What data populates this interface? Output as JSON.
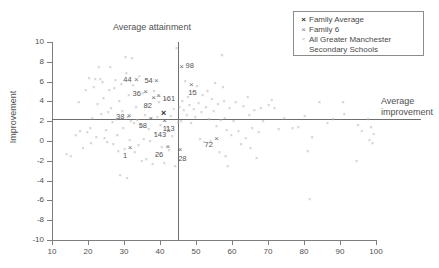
{
  "chart_data": {
    "type": "scatter",
    "title": "",
    "xlabel": "",
    "ylabel": "Improvement",
    "xlim": [
      10,
      100
    ],
    "ylim": [
      -10,
      10
    ],
    "xticks": [
      10,
      20,
      30,
      40,
      50,
      60,
      70,
      80,
      90,
      100
    ],
    "yticks": [
      -10,
      -8,
      -6,
      -4,
      -2,
      0,
      2,
      4,
      6,
      8,
      10
    ],
    "grid": false,
    "annotations": {
      "average_attainment_label": "Average attainment",
      "average_improvement_label_line1": "Average",
      "average_improvement_label_line2": "improvement",
      "average_attainment_value": 45,
      "average_improvement_value": 2.2
    },
    "legend": {
      "position": "top-right",
      "entries": [
        {
          "marker": "x",
          "style": "bold",
          "label": "Family Average"
        },
        {
          "marker": "x",
          "style": "medium",
          "label": "Family 6"
        },
        {
          "marker": "x",
          "style": "small",
          "label": "All Greater Manchester",
          "label_line2": "Secondary Schools"
        }
      ]
    },
    "series": [
      {
        "name": "Family Average",
        "marker": "bold-x",
        "points": [
          {
            "x": 41.0,
            "y": 2.7,
            "label": ""
          }
        ]
      },
      {
        "name": "Family 6",
        "marker": "x",
        "points": [
          {
            "x": 33.4,
            "y": 6.2,
            "label": "44"
          },
          {
            "x": 39.0,
            "y": 6.1,
            "label": "54"
          },
          {
            "x": 36.0,
            "y": 4.9,
            "label": "36"
          },
          {
            "x": 38.2,
            "y": 4.3,
            "label": "82"
          },
          {
            "x": 39.6,
            "y": 4.5,
            "label": "161"
          },
          {
            "x": 31.4,
            "y": 2.5,
            "label": "38"
          },
          {
            "x": 37.4,
            "y": 2.2,
            "label": "58"
          },
          {
            "x": 41.3,
            "y": 2.0,
            "label": "113"
          },
          {
            "x": 42.4,
            "y": 1.0,
            "label": "143"
          },
          {
            "x": 42.2,
            "y": -0.6,
            "label": "26"
          },
          {
            "x": 31.7,
            "y": -0.7,
            "label": "1"
          },
          {
            "x": 45.6,
            "y": -0.9,
            "label": "28"
          },
          {
            "x": 46.0,
            "y": 7.5,
            "label": "98"
          },
          {
            "x": 48.7,
            "y": 5.7,
            "label": "15"
          },
          {
            "x": 55.7,
            "y": 0.2,
            "label": "72"
          }
        ]
      },
      {
        "name": "All Greater Manchester Secondary Schools",
        "marker": "dot-x",
        "points": [
          {
            "x": 14.0,
            "y": -1.4
          },
          {
            "x": 15.2,
            "y": -1.6
          },
          {
            "x": 16.6,
            "y": 0.6
          },
          {
            "x": 17.4,
            "y": 3.9
          },
          {
            "x": 17.8,
            "y": 1.0
          },
          {
            "x": 18.6,
            "y": -0.8
          },
          {
            "x": 19.4,
            "y": 5.1
          },
          {
            "x": 19.8,
            "y": 0.9
          },
          {
            "x": 20.3,
            "y": 6.3
          },
          {
            "x": 20.6,
            "y": 1.3
          },
          {
            "x": 20.8,
            "y": -0.3
          },
          {
            "x": 21.2,
            "y": 2.3
          },
          {
            "x": 21.6,
            "y": 5.4
          },
          {
            "x": 22.0,
            "y": 6.2
          },
          {
            "x": 22.3,
            "y": 0.4
          },
          {
            "x": 22.6,
            "y": 3.7
          },
          {
            "x": 23.0,
            "y": 7.4
          },
          {
            "x": 23.4,
            "y": 6.2
          },
          {
            "x": 23.7,
            "y": 2.7
          },
          {
            "x": 24.0,
            "y": 5.9
          },
          {
            "x": 24.3,
            "y": 4.3
          },
          {
            "x": 24.6,
            "y": 0.3
          },
          {
            "x": 25.0,
            "y": 1.1
          },
          {
            "x": 25.3,
            "y": -0.2
          },
          {
            "x": 25.6,
            "y": 2.9
          },
          {
            "x": 25.9,
            "y": 5.1
          },
          {
            "x": 26.2,
            "y": 7.4
          },
          {
            "x": 26.4,
            "y": 3.3
          },
          {
            "x": 26.8,
            "y": 1.9
          },
          {
            "x": 27.0,
            "y": -0.4
          },
          {
            "x": 27.3,
            "y": 5.3
          },
          {
            "x": 27.6,
            "y": 6.1
          },
          {
            "x": 27.9,
            "y": 2.2
          },
          {
            "x": 28.1,
            "y": 0.6
          },
          {
            "x": 28.4,
            "y": -1.1
          },
          {
            "x": 28.7,
            "y": 4.0
          },
          {
            "x": 28.9,
            "y": -3.5
          },
          {
            "x": 29.2,
            "y": 5.7
          },
          {
            "x": 29.5,
            "y": 3.0
          },
          {
            "x": 29.8,
            "y": 1.3
          },
          {
            "x": 30.1,
            "y": -0.9
          },
          {
            "x": 30.4,
            "y": 8.4
          },
          {
            "x": 30.6,
            "y": 6.8
          },
          {
            "x": 30.8,
            "y": -3.8
          },
          {
            "x": 31.0,
            "y": 2.4
          },
          {
            "x": 31.3,
            "y": 4.6
          },
          {
            "x": 31.6,
            "y": 0.1
          },
          {
            "x": 31.9,
            "y": 2.0
          },
          {
            "x": 32.2,
            "y": 8.3
          },
          {
            "x": 32.5,
            "y": 5.6
          },
          {
            "x": 32.8,
            "y": 1.8
          },
          {
            "x": 33.0,
            "y": -1.2
          },
          {
            "x": 33.3,
            "y": 3.4
          },
          {
            "x": 33.7,
            "y": 2.1
          },
          {
            "x": 34.0,
            "y": -0.5
          },
          {
            "x": 34.3,
            "y": 6.5
          },
          {
            "x": 34.6,
            "y": 1.5
          },
          {
            "x": 34.9,
            "y": -2.1
          },
          {
            "x": 35.2,
            "y": 4.8
          },
          {
            "x": 35.5,
            "y": 0.2
          },
          {
            "x": 35.8,
            "y": 2.6
          },
          {
            "x": 36.2,
            "y": -1.9
          },
          {
            "x": 36.6,
            "y": 3.6
          },
          {
            "x": 36.9,
            "y": 1.2
          },
          {
            "x": 37.2,
            "y": -0.1
          },
          {
            "x": 37.6,
            "y": 2.3
          },
          {
            "x": 37.9,
            "y": -2.4
          },
          {
            "x": 38.3,
            "y": 5.0
          },
          {
            "x": 38.6,
            "y": 0.8
          },
          {
            "x": 38.9,
            "y": -1.5
          },
          {
            "x": 39.3,
            "y": 2.4
          },
          {
            "x": 39.7,
            "y": 3.9
          },
          {
            "x": 40.1,
            "y": 1.6
          },
          {
            "x": 40.5,
            "y": -0.7
          },
          {
            "x": 40.8,
            "y": 2.8
          },
          {
            "x": 41.2,
            "y": -2.3
          },
          {
            "x": 41.6,
            "y": 4.2
          },
          {
            "x": 42.0,
            "y": 1.4
          },
          {
            "x": 42.5,
            "y": -1.0
          },
          {
            "x": 43.0,
            "y": 2.5
          },
          {
            "x": 43.4,
            "y": 0.5
          },
          {
            "x": 43.8,
            "y": 3.2
          },
          {
            "x": 44.2,
            "y": -2.6
          },
          {
            "x": 44.6,
            "y": 9.3
          },
          {
            "x": 45.0,
            "y": 1.9
          },
          {
            "x": 45.4,
            "y": 3.4
          },
          {
            "x": 45.8,
            "y": 2.0
          },
          {
            "x": 46.2,
            "y": 4.0
          },
          {
            "x": 46.6,
            "y": 3.1
          },
          {
            "x": 47.0,
            "y": 6.0
          },
          {
            "x": 47.4,
            "y": 2.6
          },
          {
            "x": 47.8,
            "y": 4.4
          },
          {
            "x": 48.2,
            "y": 3.6
          },
          {
            "x": 48.6,
            "y": 1.8
          },
          {
            "x": 49.0,
            "y": 4.9
          },
          {
            "x": 49.4,
            "y": 3.2
          },
          {
            "x": 49.8,
            "y": 2.4
          },
          {
            "x": 50.3,
            "y": 5.5
          },
          {
            "x": 50.7,
            "y": 3.8
          },
          {
            "x": 51.1,
            "y": 0.2
          },
          {
            "x": 51.5,
            "y": 2.9
          },
          {
            "x": 51.9,
            "y": 4.6
          },
          {
            "x": 52.3,
            "y": -0.2
          },
          {
            "x": 52.8,
            "y": 3.4
          },
          {
            "x": 53.2,
            "y": 5.0
          },
          {
            "x": 53.6,
            "y": 2.2
          },
          {
            "x": 54.0,
            "y": 0.0
          },
          {
            "x": 54.4,
            "y": 4.2
          },
          {
            "x": 54.9,
            "y": 3.0
          },
          {
            "x": 55.3,
            "y": 5.8
          },
          {
            "x": 55.7,
            "y": 1.5
          },
          {
            "x": 56.1,
            "y": 3.7
          },
          {
            "x": 56.5,
            "y": -1.2
          },
          {
            "x": 56.9,
            "y": 2.1
          },
          {
            "x": 57.2,
            "y": 8.6
          },
          {
            "x": 57.5,
            "y": 5.4
          },
          {
            "x": 57.8,
            "y": 4.0
          },
          {
            "x": 58.0,
            "y": 2.3
          },
          {
            "x": 58.2,
            "y": -1.6
          },
          {
            "x": 58.5,
            "y": 1.1
          },
          {
            "x": 58.8,
            "y": -2.6
          },
          {
            "x": 59.3,
            "y": 3.3
          },
          {
            "x": 59.8,
            "y": 0.6
          },
          {
            "x": 60.4,
            "y": 2.0
          },
          {
            "x": 61.0,
            "y": 3.9
          },
          {
            "x": 61.8,
            "y": 1.0
          },
          {
            "x": 62.5,
            "y": -0.4
          },
          {
            "x": 63.2,
            "y": 3.5
          },
          {
            "x": 63.8,
            "y": 0.3
          },
          {
            "x": 64.4,
            "y": 4.4
          },
          {
            "x": 64.8,
            "y": 2.6
          },
          {
            "x": 65.1,
            "y": -0.8
          },
          {
            "x": 65.6,
            "y": 1.3
          },
          {
            "x": 66.2,
            "y": 3.1
          },
          {
            "x": 66.8,
            "y": -1.8
          },
          {
            "x": 67.4,
            "y": 0.9
          },
          {
            "x": 68.0,
            "y": 3.3
          },
          {
            "x": 68.6,
            "y": 2.0
          },
          {
            "x": 70.2,
            "y": 3.6
          },
          {
            "x": 71.0,
            "y": 4.1
          },
          {
            "x": 71.8,
            "y": 3.3
          },
          {
            "x": 73.0,
            "y": 1.2
          },
          {
            "x": 74.5,
            "y": 2.3
          },
          {
            "x": 76.8,
            "y": 1.3
          },
          {
            "x": 78.4,
            "y": 1.4
          },
          {
            "x": 80.2,
            "y": 2.5
          },
          {
            "x": 81.0,
            "y": -1.1
          },
          {
            "x": 81.6,
            "y": -5.9
          },
          {
            "x": 82.2,
            "y": 0.4
          },
          {
            "x": 84.3,
            "y": 3.9
          },
          {
            "x": 88.0,
            "y": 2.2
          },
          {
            "x": 90.8,
            "y": 3.9
          },
          {
            "x": 91.2,
            "y": 2.7
          },
          {
            "x": 94.6,
            "y": -2.1
          },
          {
            "x": 96.0,
            "y": 1.0
          },
          {
            "x": 97.8,
            "y": 2.2
          },
          {
            "x": 98.2,
            "y": 0.1
          },
          {
            "x": 98.6,
            "y": 1.4
          },
          {
            "x": 99.0,
            "y": -0.3
          },
          {
            "x": 99.4,
            "y": 0.7
          },
          {
            "x": 95.0,
            "y": 1.6
          },
          {
            "x": 86.5,
            "y": 1.8
          }
        ]
      }
    ]
  }
}
